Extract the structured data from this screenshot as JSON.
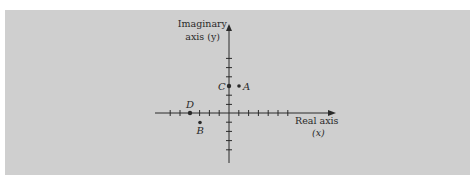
{
  "diagram": {
    "type": "complex-plane",
    "axes": {
      "x_label_line1": "Real axis",
      "x_label_line2": "(x)",
      "y_label_line1": "Imaginary",
      "y_label_line2": "axis (y)"
    },
    "points": [
      {
        "name": "A",
        "x": 1,
        "y": 3
      },
      {
        "name": "B",
        "x": -3,
        "y": -1
      },
      {
        "name": "C",
        "x": 0,
        "y": 3
      },
      {
        "name": "D",
        "x": -4,
        "y": 0
      }
    ],
    "ticks": {
      "x_min": -7,
      "x_max": 9,
      "y_min": -5,
      "y_max": 7
    },
    "colors": {
      "background": "#cfcfcf",
      "ink": "#2a2a2a"
    }
  }
}
